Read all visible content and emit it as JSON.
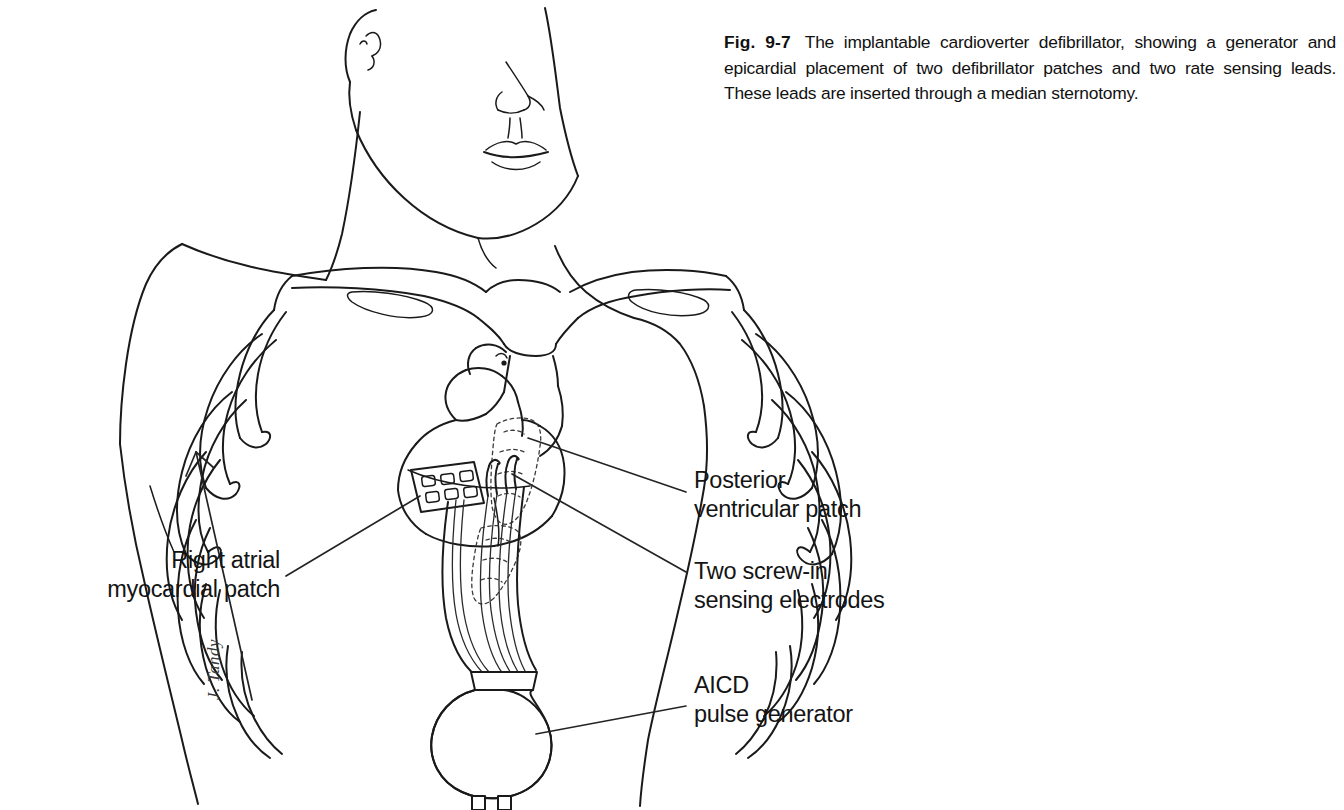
{
  "figure": {
    "number": "Fig. 9-7",
    "caption": "The implantable cardioverter defibrillator, showing a generator and epicardial placement of two defibrillator patches and two rate sensing leads. These leads are inserted through a median sternotomy.",
    "signature": "J. Tandy"
  },
  "annotations": {
    "posterior_ventricular_patch": "Posterior\nventricular patch",
    "two_screw_in_sensing_electrodes": "Two screw-in\nsensing electrodes",
    "aicd_pulse_generator": "AICD\npulse generator",
    "right_atrial_myocardial_patch": "Right atrial\nmyocardial patch"
  },
  "colors": {
    "ink": "#1a1a1a",
    "background": "#ffffff",
    "leader": "#242424"
  }
}
